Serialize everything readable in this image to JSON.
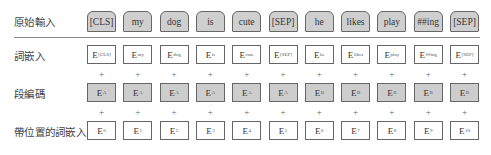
{
  "labels": {
    "input": "原始輸入",
    "token_embeddings": "詞嵌入",
    "segment_embeddings": "段編碼",
    "position_embeddings": "帶位置的詞嵌入"
  },
  "plus_sign": "+",
  "tokens": [
    "[CLS]",
    "my",
    "dog",
    "is",
    "cute",
    "[SEP]",
    "he",
    "likes",
    "play",
    "##ing",
    "[SEP]"
  ],
  "token_embeddings": [
    {
      "base": "E",
      "sub": "[CLS]"
    },
    {
      "base": "E",
      "sub": "my"
    },
    {
      "base": "E",
      "sub": "dog"
    },
    {
      "base": "E",
      "sub": "is"
    },
    {
      "base": "E",
      "sub": "cute"
    },
    {
      "base": "E",
      "sub": "[SEP]"
    },
    {
      "base": "E",
      "sub": "he"
    },
    {
      "base": "E",
      "sub": "likes"
    },
    {
      "base": "E",
      "sub": "play"
    },
    {
      "base": "E",
      "sub": "##ing"
    },
    {
      "base": "E",
      "sub": "[SEP]"
    }
  ],
  "segment_embeddings": [
    {
      "base": "E",
      "sub": "A"
    },
    {
      "base": "E",
      "sub": "A"
    },
    {
      "base": "E",
      "sub": "A"
    },
    {
      "base": "E",
      "sub": "A"
    },
    {
      "base": "E",
      "sub": "A"
    },
    {
      "base": "E",
      "sub": "A"
    },
    {
      "base": "E",
      "sub": "B"
    },
    {
      "base": "E",
      "sub": "B"
    },
    {
      "base": "E",
      "sub": "B"
    },
    {
      "base": "E",
      "sub": "B"
    },
    {
      "base": "E",
      "sub": "B"
    }
  ],
  "position_embeddings": [
    {
      "base": "E",
      "sub": "0"
    },
    {
      "base": "E",
      "sub": "1"
    },
    {
      "base": "E",
      "sub": "2"
    },
    {
      "base": "E",
      "sub": "3"
    },
    {
      "base": "E",
      "sub": "4"
    },
    {
      "base": "E",
      "sub": "5"
    },
    {
      "base": "E",
      "sub": "6"
    },
    {
      "base": "E",
      "sub": "7"
    },
    {
      "base": "E",
      "sub": "8"
    },
    {
      "base": "E",
      "sub": "9"
    },
    {
      "base": "E",
      "sub": "10"
    }
  ],
  "colors": {
    "token_fill": "#cfcfcf",
    "segment_fill": "#cdcdcd",
    "embedding_fill": "#ffffff",
    "border": "#666666"
  }
}
